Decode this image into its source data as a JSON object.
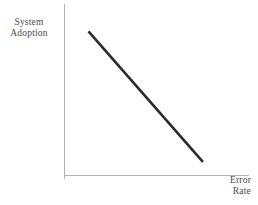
{
  "chart_data": {
    "type": "line",
    "title": "",
    "subtitle": "",
    "xlabel": "Error Rate",
    "xlabel_lines": [
      "Error",
      "Rate"
    ],
    "ylabel": "System Adoption",
    "ylabel_lines": [
      "System",
      "Adoption"
    ],
    "grid": false,
    "legend": null,
    "legend_position": "none",
    "xlim": [
      0,
      1
    ],
    "ylim": [
      0,
      1
    ],
    "xticks": [],
    "yticks": [],
    "xticklabels": [],
    "yticklabels": [],
    "annotations": [],
    "series": [
      {
        "name": "System Adoption vs Error Rate",
        "x": [
          0.13,
          0.75
        ],
        "y": [
          0.84,
          0.08
        ],
        "color": "#2b2b2b",
        "linewidth": 2.6,
        "style": "solid",
        "markers": "none"
      }
    ],
    "axis_color": "#b3b3b3",
    "background_color": "#ffffff"
  },
  "figure": {
    "y_axis_label": "System\nAdoption",
    "x_axis_label": "Error\nRate",
    "y_label_line1": "System",
    "y_label_line2": "Adoption",
    "x_label_line1": "Error",
    "x_label_line2": "Rate"
  }
}
